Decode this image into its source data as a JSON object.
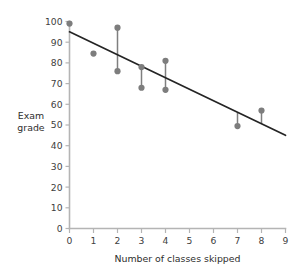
{
  "chart_data": {
    "type": "scatter",
    "title": "",
    "subtitle": "",
    "xlabel": "Number of classes skipped",
    "ylabel": "Exam grade",
    "ylabel_line1": "Exam",
    "ylabel_line2": "grade",
    "xlim": [
      0,
      9
    ],
    "ylim": [
      0,
      100
    ],
    "grid": false,
    "legend": null,
    "xticks": [
      0,
      1,
      2,
      3,
      4,
      5,
      6,
      7,
      8,
      9
    ],
    "xtick_labels": [
      "0",
      "1",
      "2",
      "3",
      "4",
      "5",
      "6",
      "7",
      "8",
      "9"
    ],
    "yticks": [
      0,
      10,
      20,
      30,
      40,
      50,
      60,
      70,
      80,
      90,
      100
    ],
    "ytick_labels": [
      "0",
      "10",
      "20",
      "30",
      "40",
      "50",
      "60",
      "70",
      "80",
      "90",
      "100"
    ],
    "point_color": "#7d7d7d",
    "line_color": "#242424",
    "residual_color": "#7f7f7f",
    "axis_color": "#b4b4b4",
    "points": [
      {
        "x": 0,
        "y": 99
      },
      {
        "x": 1,
        "y": 84.5
      },
      {
        "x": 2,
        "y": 97
      },
      {
        "x": 2,
        "y": 76
      },
      {
        "x": 3,
        "y": 78
      },
      {
        "x": 3,
        "y": 68
      },
      {
        "x": 4,
        "y": 81
      },
      {
        "x": 4,
        "y": 67
      },
      {
        "x": 7,
        "y": 49.5
      },
      {
        "x": 8,
        "y": 57
      }
    ],
    "residuals": [
      {
        "x": 2,
        "y_point": 97,
        "y_fit": 83.9
      },
      {
        "x": 2,
        "y_point": 76,
        "y_fit": 83.9
      },
      {
        "x": 3,
        "y_point": 78,
        "y_fit": 78.3
      },
      {
        "x": 3,
        "y_point": 68,
        "y_fit": 78.3
      },
      {
        "x": 4,
        "y_point": 81,
        "y_fit": 72.8
      },
      {
        "x": 4,
        "y_point": 67,
        "y_fit": 72.8
      },
      {
        "x": 7,
        "y_point": 49.5,
        "y_fit": 56.1
      },
      {
        "x": 8,
        "y_point": 57,
        "y_fit": 50.6
      }
    ],
    "fit_line": {
      "x_start": 0,
      "y_start": 95,
      "x_end": 9,
      "y_end": 45,
      "slope": -5.56,
      "intercept": 95
    }
  }
}
